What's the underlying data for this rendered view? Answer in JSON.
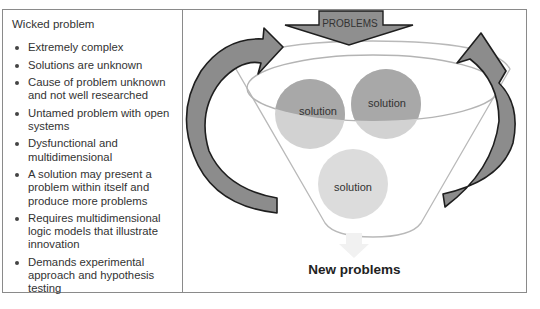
{
  "left_panel": {
    "title": "Wicked problem",
    "bullets": [
      "Extremely complex",
      "Solutions are unknown",
      "Cause of problem unknown and not well researched",
      "Untamed problem with open systems",
      "Dysfunctional and multidimensional",
      "A solution may present a problem within itself and produce more problems",
      "Requires multidimensional logic models that illustrate innovation",
      "Demands experimental approach and hypothesis testing"
    ]
  },
  "diagram": {
    "input_arrow_label": "PROBLEMS",
    "solutions": [
      "solution",
      "solution",
      "solution"
    ],
    "output_label": "New problems",
    "colors": {
      "arrow_fill": "#8c8c8c",
      "arrow_stroke": "#1e1e1e",
      "circle_dark": "#a9a9a9",
      "circle_light": "#d2d2d2",
      "funnel_stroke": "#b4b4b4"
    }
  }
}
